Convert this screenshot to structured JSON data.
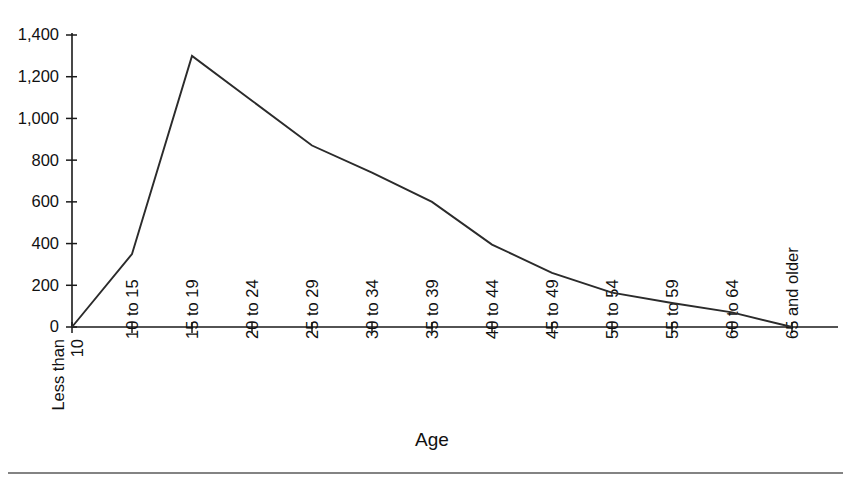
{
  "chart_data": {
    "type": "line",
    "title": "",
    "xlabel": "Age",
    "ylabel": "",
    "categories": [
      "Less than 10",
      "10 to 15",
      "15 to 19",
      "20 to 24",
      "25 to 29",
      "30 to 34",
      "35 to 39",
      "40 to 44",
      "45 to 49",
      "50 to 54",
      "55 to 59",
      "60 to 64",
      "65 and older"
    ],
    "values": [
      0,
      350,
      1300,
      1085,
      870,
      740,
      600,
      395,
      260,
      165,
      115,
      70,
      0
    ],
    "ylim": [
      0,
      1400
    ],
    "yticks": [
      0,
      200,
      400,
      600,
      800,
      1000,
      1200,
      1400
    ],
    "ytick_labels": [
      "0",
      "200",
      "400",
      "600",
      "800",
      "1,000",
      "1,200",
      "1,400"
    ],
    "grid": false,
    "legend": "none",
    "series": [
      {
        "name": "count",
        "values": [
          0,
          350,
          1300,
          1085,
          870,
          740,
          600,
          395,
          260,
          165,
          115,
          70,
          0
        ],
        "color": "#2b2b2b"
      }
    ]
  },
  "axis": {
    "x_title": "Age",
    "first_category_lines": [
      "Less than",
      "10"
    ]
  },
  "colors": {
    "line": "#2b2b2b",
    "axis": "#1a1a1a",
    "text": "#111111",
    "background": "#ffffff",
    "rule": "#5a5a5a"
  }
}
